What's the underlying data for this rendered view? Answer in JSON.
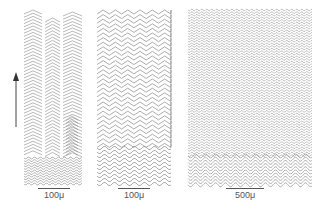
{
  "figure": {
    "panels": [
      {
        "id": "a",
        "pattern": "three chevron columns growing upward from horizontal wavy base",
        "scale_label": "100μ"
      },
      {
        "id": "b",
        "pattern": "chevron rows transitioning to sinusoidal wavy rows at bottom",
        "scale_label": "100μ"
      },
      {
        "id": "c",
        "pattern": "dense fine wavy rows, larger undulations at bottom",
        "scale_label": "500μ"
      }
    ],
    "arrow": {
      "direction": "up",
      "icon": "arrow-up-icon"
    },
    "line_color": "#8a8a8a"
  }
}
